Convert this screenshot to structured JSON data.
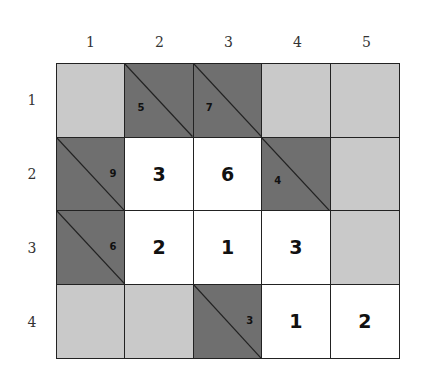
{
  "columns": [
    "1",
    "2",
    "3",
    "4",
    "5"
  ],
  "rows": [
    "1",
    "2",
    "3",
    "4"
  ],
  "colors": {
    "blank": "#c9c9c9",
    "clue": "#6f6f6f",
    "entry": "#ffffff",
    "line": "#222222"
  },
  "cells": [
    [
      {
        "type": "blank"
      },
      {
        "type": "clue",
        "down": "5",
        "across": ""
      },
      {
        "type": "clue",
        "down": "7",
        "across": ""
      },
      {
        "type": "blank"
      },
      {
        "type": "blank"
      }
    ],
    [
      {
        "type": "clue",
        "down": "",
        "across": "9"
      },
      {
        "type": "entry",
        "value": "3"
      },
      {
        "type": "entry",
        "value": "6"
      },
      {
        "type": "clue",
        "down": "4",
        "across": ""
      },
      {
        "type": "blank"
      }
    ],
    [
      {
        "type": "clue",
        "down": "",
        "across": "6"
      },
      {
        "type": "entry",
        "value": "2"
      },
      {
        "type": "entry",
        "value": "1"
      },
      {
        "type": "entry",
        "value": "3"
      },
      {
        "type": "blank"
      }
    ],
    [
      {
        "type": "blank"
      },
      {
        "type": "blank"
      },
      {
        "type": "clue",
        "down": "",
        "across": "3"
      },
      {
        "type": "entry",
        "value": "1"
      },
      {
        "type": "entry",
        "value": "2"
      }
    ]
  ]
}
